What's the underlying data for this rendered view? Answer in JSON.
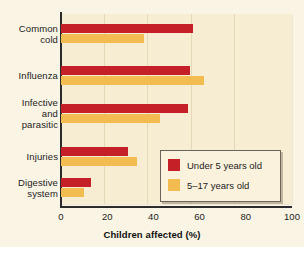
{
  "chart_data": {
    "type": "bar",
    "orientation": "horizontal",
    "title": "",
    "xlabel": "Children affected (%)",
    "ylabel": "",
    "xlim": [
      0,
      100
    ],
    "xticks": [
      0,
      20,
      40,
      60,
      80,
      100
    ],
    "xtick_labels": [
      "0",
      "20",
      "40",
      "60",
      "80",
      "100"
    ],
    "grid": false,
    "legend_position": "inside-lower-right",
    "categories": [
      "Common cold",
      "Influenza",
      "Infective and parasitic",
      "Injuries",
      "Digestive system"
    ],
    "category_lines": [
      [
        "Common",
        "cold"
      ],
      [
        "Influenza"
      ],
      [
        "Infective",
        "and",
        "parasitic"
      ],
      [
        "Injuries"
      ],
      [
        "Digestive",
        "system"
      ]
    ],
    "series": [
      {
        "name": "Under 5 years old",
        "color": "#C52027",
        "values": [
          57,
          56,
          55,
          29,
          13
        ]
      },
      {
        "name": "5–17 years old",
        "color": "#F3BC51",
        "values": [
          36,
          62,
          43,
          33,
          10
        ]
      }
    ]
  },
  "colors": {
    "red": "#C52027",
    "yellow": "#F3BC51",
    "plot_background": "#F7EDD2",
    "page_background": "#FAF4E4",
    "axis": "#2b2b2b"
  }
}
